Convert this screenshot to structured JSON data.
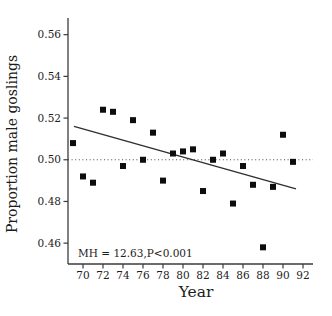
{
  "figure": {
    "background": "#ffffff"
  },
  "chart_data": {
    "type": "scatter",
    "title": "",
    "xlabel": "Year",
    "ylabel": "Proportion male goslings",
    "annotation": "MH = 12.63,P<0.001",
    "xlim": [
      68.5,
      93
    ],
    "ylim": [
      0.45,
      0.568
    ],
    "grid": false,
    "x_tick_values": [
      70,
      72,
      74,
      76,
      78,
      80,
      82,
      84,
      86,
      88,
      90,
      92
    ],
    "x_tick_labels": [
      "70",
      "72",
      "74",
      "76",
      "78",
      "80",
      "82",
      "84",
      "86",
      "88",
      "90",
      "92"
    ],
    "y_tick_values": [
      0.46,
      0.48,
      0.5,
      0.52,
      0.54,
      0.56
    ],
    "y_tick_labels": [
      "0.46",
      "0.48",
      "0.50",
      "0.52",
      "0.54",
      "0.56"
    ],
    "reference_line_y": 0.5,
    "trend_line": {
      "x1": 69.1,
      "y1": 0.516,
      "x2": 91.3,
      "y2": 0.486
    },
    "points": [
      {
        "year": 69,
        "value": 0.508
      },
      {
        "year": 70,
        "value": 0.492
      },
      {
        "year": 71,
        "value": 0.489
      },
      {
        "year": 72,
        "value": 0.524
      },
      {
        "year": 73,
        "value": 0.523
      },
      {
        "year": 74,
        "value": 0.497
      },
      {
        "year": 75,
        "value": 0.519
      },
      {
        "year": 76,
        "value": 0.5
      },
      {
        "year": 77,
        "value": 0.513
      },
      {
        "year": 78,
        "value": 0.49
      },
      {
        "year": 79,
        "value": 0.503
      },
      {
        "year": 80,
        "value": 0.504
      },
      {
        "year": 81,
        "value": 0.505
      },
      {
        "year": 82,
        "value": 0.485
      },
      {
        "year": 83,
        "value": 0.5
      },
      {
        "year": 84,
        "value": 0.503
      },
      {
        "year": 85,
        "value": 0.479
      },
      {
        "year": 86,
        "value": 0.497
      },
      {
        "year": 87,
        "value": 0.488
      },
      {
        "year": 88,
        "value": 0.458
      },
      {
        "year": 89,
        "value": 0.487
      },
      {
        "year": 90,
        "value": 0.512
      },
      {
        "year": 91,
        "value": 0.499
      }
    ],
    "colors": {
      "points": "#0d0d0d",
      "trend_line": "#2e2e2e",
      "reference_line": "#4a4a4a",
      "axis": "#3b3b3b",
      "text": "#1c1c1c"
    }
  }
}
